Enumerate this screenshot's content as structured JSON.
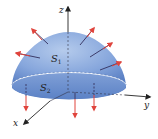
{
  "diagram": {
    "labels": {
      "z_axis": "z",
      "y_axis": "y",
      "x_axis": "x",
      "surface_top": "S",
      "surface_top_sub": "1",
      "surface_base": "S",
      "surface_base_sub": "2"
    },
    "colors": {
      "surface_fill_light": "#a9c0e6",
      "surface_fill_dark": "#5f86c9",
      "base_fill": "#7096d2",
      "normal_arrow": "#e0443c",
      "axis": "#333333",
      "background": "#ffffff"
    }
  }
}
